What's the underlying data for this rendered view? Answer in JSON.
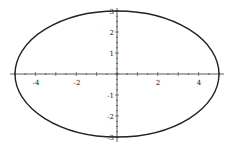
{
  "chart_data": {
    "type": "line",
    "title": "",
    "xlabel": "",
    "ylabel": "",
    "series": [
      {
        "name": "ellipse",
        "semi_major_x": 5,
        "semi_minor_y": 3,
        "center": [
          0,
          0
        ]
      }
    ],
    "xlim": [
      -5.2,
      5.2
    ],
    "ylim": [
      -3,
      3
    ],
    "x_ticks": [
      "-4",
      "-2",
      "2",
      "4"
    ],
    "y_ticks": [
      "3",
      "2",
      "1",
      "-1",
      "-2",
      "-3"
    ],
    "grid": false,
    "legend": null
  }
}
